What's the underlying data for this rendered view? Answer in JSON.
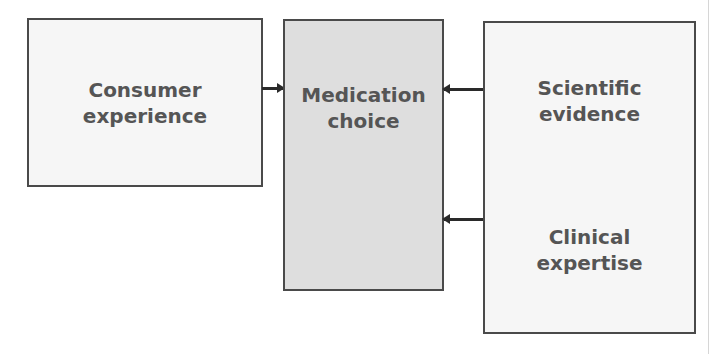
{
  "diagram": {
    "nodes": [
      {
        "id": "consumer-experience",
        "label": "Consumer\nexperience"
      },
      {
        "id": "medication-choice",
        "label": "Medication\nchoice"
      },
      {
        "id": "scientific-evidence",
        "label": "Scientific\nevidence"
      },
      {
        "id": "clinical-expertise",
        "label": "Clinical\nexpertise"
      }
    ],
    "edges": [
      {
        "from": "consumer-experience",
        "to": "medication-choice"
      },
      {
        "from": "scientific-evidence",
        "to": "medication-choice"
      },
      {
        "from": "clinical-expertise",
        "to": "medication-choice"
      }
    ],
    "colors": {
      "border": "#4a4a4a",
      "text": "#555555",
      "light_fill": "#f6f6f6",
      "center_fill": "#dedede",
      "arrow": "#2a2a2a"
    }
  }
}
